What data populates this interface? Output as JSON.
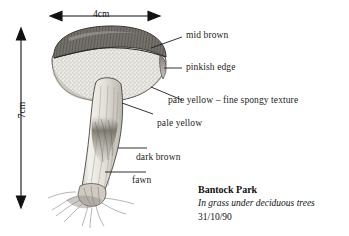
{
  "figure": {
    "background_color": "#ffffff",
    "ink_color": "#1c1c1c"
  },
  "dimensions": {
    "width_label": "4cm",
    "height_label": "7cm"
  },
  "labels": [
    {
      "id": "mid-brown",
      "text": "mid brown",
      "x": 186,
      "y": 31
    },
    {
      "id": "pinkish-edge",
      "text": "pinkish edge",
      "x": 186,
      "y": 63
    },
    {
      "id": "pale-yellow-spongy",
      "text": "pale yellow – fine spongy texture",
      "x": 168,
      "y": 96
    },
    {
      "id": "pale-yellow",
      "text": "pale yellow",
      "x": 157,
      "y": 119
    },
    {
      "id": "dark-brown",
      "text": "dark brown",
      "x": 136,
      "y": 153
    },
    {
      "id": "fawn",
      "text": "fawn",
      "x": 132,
      "y": 176
    }
  ],
  "caption": {
    "site": "Bantock Park",
    "habitat": "In grass under deciduous trees",
    "date": "31/10/90"
  },
  "colors": {
    "cap_top": "#6e6a66",
    "cap_pores": "#e8e6e0",
    "stem": "#dedbd4",
    "stem_dark_patch": "#7d7a73",
    "line": "#1c1c1c"
  }
}
